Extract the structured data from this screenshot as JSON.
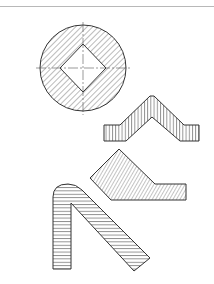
{
  "diagram": {
    "type": "technical-drawing-section-views",
    "stroke_color": "#333333",
    "hatch_color": "#555555",
    "background": "#ffffff",
    "figures": [
      {
        "id": "round-bar-square-hole",
        "hatch": "diagonal-45"
      },
      {
        "id": "bent-strip",
        "hatch": "vertical"
      },
      {
        "id": "angled-plate",
        "hatch": "diagonal-60"
      },
      {
        "id": "hook-bend",
        "hatch": "horizontal"
      }
    ]
  }
}
